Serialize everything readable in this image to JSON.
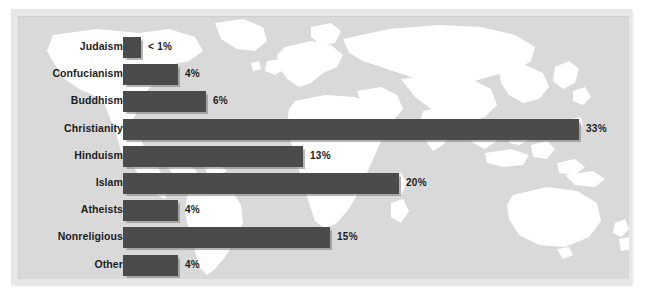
{
  "figure": {
    "background_color": "#ffffff",
    "plate_color": "#e7e7e7",
    "canvas_color": "#d9d9d9",
    "land_color": "#ffffff",
    "bar_color": "#4b4b4b",
    "text_color": "#1d1d1d",
    "background_image_name": "world-map-silhouette"
  },
  "chart_data": {
    "type": "bar",
    "orientation": "horizontal",
    "title": "",
    "subtitle": "",
    "xlabel": "",
    "ylabel": "",
    "grid": false,
    "legend": "none",
    "xlim": [
      0,
      33
    ],
    "categories": [
      "Judaism",
      "Confucianism",
      "Buddhism",
      "Christianity",
      "Hinduism",
      "Islam",
      "Atheists",
      "Nonreligious",
      "Other"
    ],
    "values": [
      0.5,
      4,
      6,
      33,
      13,
      20,
      4,
      15,
      4
    ],
    "value_labels": [
      "< 1%",
      "4%",
      "6%",
      "33%",
      "13%",
      "20%",
      "4%",
      "15%",
      "4%"
    ],
    "bars": [
      {
        "label": "Judaism",
        "value": 0.5,
        "value_label": "< 1%"
      },
      {
        "label": "Confucianism",
        "value": 4,
        "value_label": "4%"
      },
      {
        "label": "Buddhism",
        "value": 6,
        "value_label": "6%"
      },
      {
        "label": "Christianity",
        "value": 33,
        "value_label": "33%"
      },
      {
        "label": "Hinduism",
        "value": 13,
        "value_label": "13%"
      },
      {
        "label": "Islam",
        "value": 20,
        "value_label": "20%"
      },
      {
        "label": "Atheists",
        "value": 4,
        "value_label": "4%"
      },
      {
        "label": "Nonreligious",
        "value": 15,
        "value_label": "15%"
      },
      {
        "label": "Other",
        "value": 4,
        "value_label": "4%"
      }
    ]
  }
}
